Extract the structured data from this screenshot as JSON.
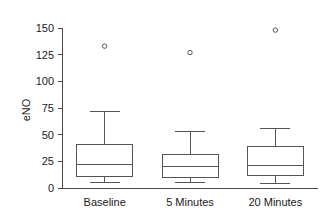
{
  "chart_data": {
    "type": "box",
    "title": "",
    "xlabel": "",
    "ylabel": "eNO",
    "ylim": [
      0,
      150
    ],
    "yticks": [
      0,
      25,
      50,
      75,
      100,
      125,
      150
    ],
    "ytick_labels": [
      "0",
      "25",
      "50",
      "75",
      "100",
      "125",
      "150"
    ],
    "grid": false,
    "legend": false,
    "categories": [
      "Baseline",
      "5 Minutes",
      "20 Minutes"
    ],
    "boxes": [
      {
        "category": "Baseline",
        "whisker_low": 5,
        "q1": 11,
        "median": 22,
        "q3": 41,
        "whisker_high": 72,
        "outliers": [
          133
        ]
      },
      {
        "category": "5 Minutes",
        "whisker_low": 5,
        "q1": 10,
        "median": 20,
        "q3": 31,
        "whisker_high": 53,
        "outliers": [
          127
        ]
      },
      {
        "category": "20 Minutes",
        "whisker_low": 4,
        "q1": 12,
        "median": 21,
        "q3": 39,
        "whisker_high": 56,
        "outliers": [
          148
        ]
      }
    ],
    "colors": {
      "box_stroke": "#555555",
      "box_fill": "#ffffff",
      "axis": "#4a4a4a",
      "text": "#1a1a1a",
      "background": "#ffffff"
    }
  }
}
